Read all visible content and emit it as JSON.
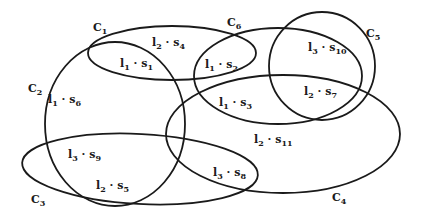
{
  "diagram": {
    "type": "overlapping-ellipses",
    "sets": [
      {
        "id": "C1",
        "label": "C",
        "sub": "1",
        "cx": 172,
        "cy": 53,
        "rx": 84,
        "ry": 27,
        "rot": 0,
        "label_x": 93,
        "label_y": 22
      },
      {
        "id": "C2",
        "label": "C",
        "sub": "2",
        "cx": 115,
        "cy": 124,
        "rx": 70,
        "ry": 82,
        "rot": 0,
        "label_x": 28,
        "label_y": 83
      },
      {
        "id": "C3",
        "label": "C",
        "sub": "3",
        "cx": 140,
        "cy": 169,
        "rx": 118,
        "ry": 35,
        "rot": 3,
        "label_x": 31,
        "label_y": 194
      },
      {
        "id": "C4",
        "label": "C",
        "sub": "4",
        "cx": 283,
        "cy": 134,
        "rx": 117,
        "ry": 59,
        "rot": 0,
        "label_x": 332,
        "label_y": 192
      },
      {
        "id": "C5",
        "label": "C",
        "sub": "5",
        "cx": 322,
        "cy": 66,
        "rx": 53,
        "ry": 54,
        "rot": 0,
        "label_x": 366,
        "label_y": 28
      },
      {
        "id": "C6",
        "label": "C",
        "sub": "6",
        "cx": 278,
        "cy": 76,
        "rx": 84,
        "ry": 48,
        "rot": 0,
        "label_x": 227,
        "label_y": 17
      }
    ],
    "elements": [
      {
        "id": "s1",
        "i": "1",
        "s": "1",
        "x": 120,
        "y": 58
      },
      {
        "id": "s2",
        "i": "1",
        "s": "2",
        "x": 205,
        "y": 59
      },
      {
        "id": "s3",
        "i": "1",
        "s": "3",
        "x": 219,
        "y": 97
      },
      {
        "id": "s4",
        "i": "2",
        "s": "4",
        "x": 152,
        "y": 37
      },
      {
        "id": "s5",
        "i": "2",
        "s": "5",
        "x": 96,
        "y": 180
      },
      {
        "id": "s6",
        "i": "1",
        "s": "6",
        "x": 48,
        "y": 94
      },
      {
        "id": "s7",
        "i": "2",
        "s": "7",
        "x": 304,
        "y": 86
      },
      {
        "id": "s8",
        "i": "3",
        "s": "8",
        "x": 213,
        "y": 167
      },
      {
        "id": "s9",
        "i": "3",
        "s": "9",
        "x": 68,
        "y": 149
      },
      {
        "id": "s10",
        "i": "3",
        "s": "10",
        "x": 308,
        "y": 42
      },
      {
        "id": "s11",
        "i": "2",
        "s": "11",
        "x": 254,
        "y": 134
      }
    ],
    "element_prefix": "I",
    "element_sep": " · ",
    "element_var": "S",
    "stroke_color": "#1a1a1a",
    "background": "#ffffff"
  }
}
